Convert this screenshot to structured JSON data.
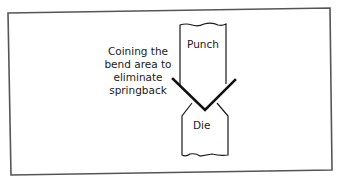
{
  "diagram": {
    "callout": {
      "lines": [
        "Coining the",
        "bend area to",
        "eliminate",
        "springback"
      ]
    },
    "labels": {
      "punch": "Punch",
      "die": "Die"
    },
    "colors": {
      "stroke": "#1a1a1a",
      "frame": "#555555",
      "background": "#ffffff"
    }
  }
}
